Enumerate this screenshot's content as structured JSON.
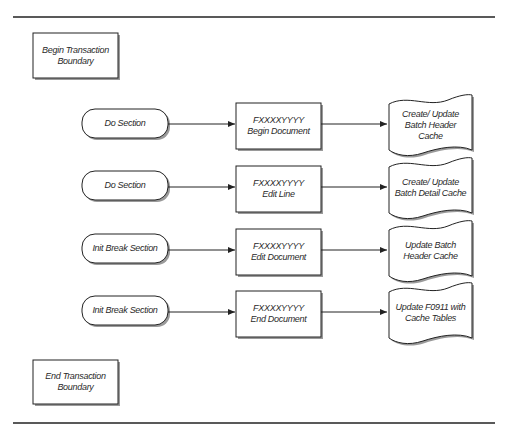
{
  "diagram": {
    "begin_boundary": "Begin Transaction\nBoundary",
    "end_boundary": "End Transaction\nBoundary",
    "rows": [
      {
        "section": "Do Section",
        "function": "FXXXXYYYY\nBegin Document",
        "output": "Create/ Update\nBatch Header\nCache"
      },
      {
        "section": "Do Section",
        "function": "FXXXXYYYY\nEdit Line",
        "output": "Create/ Update\nBatch Detail Cache"
      },
      {
        "section": "Init Break Section",
        "function": "FXXXXYYYY\nEdit Document",
        "output": "Update Batch\nHeader Cache"
      },
      {
        "section": "Init Break Section",
        "function": "FXXXXYYYY\nEnd Document",
        "output": "Update F0911 with\nCache Tables"
      }
    ],
    "colors": {
      "line": "#222222",
      "shadow": "#9a9a9a",
      "background": "#ffffff"
    }
  }
}
